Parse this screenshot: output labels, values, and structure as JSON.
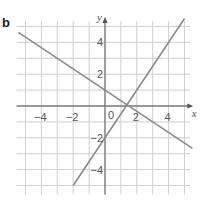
{
  "part_label": "b",
  "chart_data": {
    "type": "line",
    "title": "",
    "xlabel": "x",
    "ylabel": "y",
    "xlim": [
      -5,
      5
    ],
    "ylim": [
      -5,
      5
    ],
    "grid": true,
    "grid_step": 1,
    "x_ticks": [
      -4,
      -2,
      2,
      4
    ],
    "x_tick_labels": [
      "−4",
      "−2",
      "2",
      "4"
    ],
    "y_ticks": [
      4,
      2,
      -2,
      -4
    ],
    "y_tick_labels": [
      "4",
      "2",
      "−2",
      "−4"
    ],
    "origin_label": "0",
    "series": [
      {
        "name": "line-a",
        "equation": "y = -2/3 x + 1",
        "slope": -0.6667,
        "intercept": 1,
        "x": [
          -5.45,
          5.5
        ],
        "y": [
          4.63,
          -2.67
        ]
      },
      {
        "name": "line-b",
        "equation": "y = 3/2 x - 2",
        "slope": 1.5,
        "intercept": -2,
        "x": [
          -2,
          5
        ],
        "y": [
          -5,
          5.5
        ]
      }
    ],
    "colors": {
      "grid": "#cfcfcf",
      "axes": "#777777",
      "lines": "#8a8a8a"
    }
  }
}
